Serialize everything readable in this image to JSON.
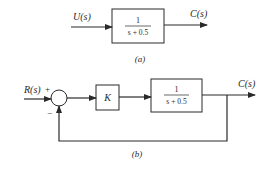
{
  "diagram_a": {
    "caption": "(a)",
    "input_label": "U(s)",
    "output_label": "C(s)",
    "block": {
      "numerator": "1",
      "denominator": "s + 0.5"
    }
  },
  "diagram_b": {
    "caption": "(b)",
    "input_label": "R(s)",
    "output_label": "C(s)",
    "sum_plus": "+",
    "sum_minus": "−",
    "gain_block": {
      "label": "K"
    },
    "plant_block": {
      "numerator": "1",
      "denominator": "s + 0.5"
    }
  },
  "colors": {
    "line": "#2a2a2a",
    "background": "#ffffff"
  }
}
